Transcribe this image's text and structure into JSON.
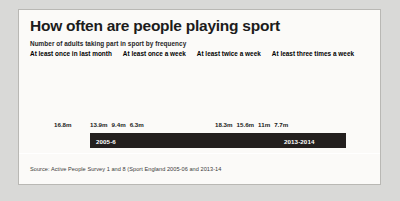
{
  "card": {
    "title": "How often are people playing sport",
    "subtitle": "Number of adults taking part in sport by frequency",
    "source": "Source: Active People Survey 1 and 8 (Sport England 2005-06 and 2013-14"
  },
  "legend": [
    {
      "label": "At least once in last month",
      "color": "#5c5c5c"
    },
    {
      "label": "At least once a week",
      "color": "#3f3f3f"
    },
    {
      "label": "At least twice a week",
      "color": "#1c1918"
    },
    {
      "label": "At least three times a week",
      "color": "#9a9a98"
    }
  ],
  "chart_data": {
    "type": "bar",
    "title": "How often are people playing sport",
    "subtitle": "Number of adults taking part in sport by frequency",
    "xlabel": "",
    "ylabel": "Number of adults (millions)",
    "ylim": [
      0,
      18.3
    ],
    "grid": false,
    "legend_position": "top",
    "categories": [
      "2005-6",
      "2013-2014"
    ],
    "series": [
      {
        "name": "At least once in last month",
        "color": "#5c5c5c",
        "values": [
          16.8,
          18.3
        ],
        "labels": [
          "16.8m",
          "18.3m"
        ]
      },
      {
        "name": "At least once a week",
        "color": "#3f3f3f",
        "values": [
          13.9,
          15.6
        ],
        "labels": [
          "13.9m",
          "15.6m"
        ]
      },
      {
        "name": "At least twice a week",
        "color": "#1c1918",
        "values": [
          9.4,
          11.0
        ],
        "labels": [
          "9.4m",
          "11m"
        ]
      },
      {
        "name": "At least three times a week",
        "color": "#9a9a98",
        "values": [
          6.3,
          7.7
        ],
        "labels": [
          "6.3m",
          "7.7m"
        ]
      }
    ],
    "groups": [
      {
        "band_label": "2005-6",
        "bars": [
          {
            "series": "At least once in last month",
            "value": 16.8,
            "label": "16.8m",
            "color": "#5c5c5c",
            "height_px": 54,
            "width_px": 32
          },
          {
            "series": "At least once a week",
            "value": 13.9,
            "label": "13.9m",
            "color": "#3f3f3f",
            "height_px": 45,
            "width_px": 31
          },
          {
            "series": "At least twice a week",
            "value": 9.4,
            "label": "9.4m",
            "color": "#1c1918",
            "height_px": 31,
            "width_px": 29
          },
          {
            "series": "At least three times a week",
            "value": 6.3,
            "label": "6.3m",
            "color": "#9a9a98",
            "height_px": 21,
            "width_px": 29
          }
        ]
      },
      {
        "band_label": "2013-2014",
        "bars": [
          {
            "series": "At least once in last month",
            "value": 18.3,
            "label": "18.3m",
            "color": "#5c5c5c",
            "height_px": 59,
            "width_px": 32
          },
          {
            "series": "At least once a week",
            "value": 15.6,
            "label": "15.6m",
            "color": "#3f3f3f",
            "height_px": 50,
            "width_px": 31
          },
          {
            "series": "At least twice a week",
            "value": 11.0,
            "label": "11m",
            "color": "#1c1918",
            "height_px": 36,
            "width_px": 29
          },
          {
            "series": "At least three times a week",
            "value": 7.7,
            "label": "7.7m",
            "color": "#9a9a98",
            "height_px": 25,
            "width_px": 29
          }
        ]
      }
    ]
  }
}
